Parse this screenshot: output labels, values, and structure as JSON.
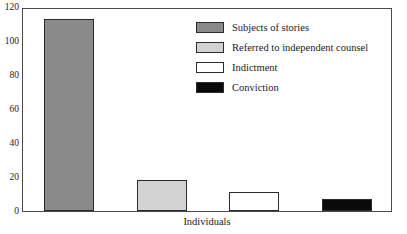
{
  "chart_data": {
    "type": "bar",
    "title": "",
    "subtitle": "",
    "xlabel": "Individuals",
    "ylabel": "",
    "categories": [
      "Subjects of stories",
      "Referred to independent counsel",
      "Indictment",
      "Conviction"
    ],
    "values": [
      113,
      18,
      11,
      7
    ],
    "ylim": [
      0,
      120
    ],
    "ytick_labels": [
      "0",
      "20",
      "40",
      "60",
      "80",
      "100",
      "120"
    ],
    "ytick_values": [
      0,
      20,
      40,
      60,
      80,
      100,
      120
    ],
    "grid": false,
    "legend_position": "upper-right",
    "series": [
      {
        "name": "Subjects of stories",
        "value": 113,
        "fill": "#8a8a8a",
        "stroke": "#2b2b2b"
      },
      {
        "name": "Referred to independent counsel",
        "value": 18,
        "fill": "#d2d2d2",
        "stroke": "#2b2b2b"
      },
      {
        "name": "Indictment",
        "value": 11,
        "fill": "#ffffff",
        "stroke": "#2b2b2b"
      },
      {
        "name": "Conviction",
        "value": 7,
        "fill": "#0a0a0a",
        "stroke": "#2b2b2b"
      }
    ]
  },
  "axis": {
    "y_ticks": [
      {
        "label": "120",
        "value": 120
      },
      {
        "label": "100",
        "value": 100
      },
      {
        "label": "80",
        "value": 80
      },
      {
        "label": "60",
        "value": 60
      },
      {
        "label": "40",
        "value": 40
      },
      {
        "label": "20",
        "value": 20
      },
      {
        "label": "0",
        "value": 0
      }
    ],
    "x_label": "Individuals"
  },
  "legend": {
    "items": [
      {
        "label": "Subjects of stories",
        "color": "#8a8a8a"
      },
      {
        "label": "Referred to independent counsel",
        "color": "#d2d2d2"
      },
      {
        "label": "Indictment",
        "color": "#ffffff"
      },
      {
        "label": "Conviction",
        "color": "#0a0a0a"
      }
    ]
  },
  "colors": {
    "frame": "#4a4a4a",
    "bar_stroke": "#2b2b2b",
    "background": "#ffffff",
    "text": "#1a1a1a"
  }
}
